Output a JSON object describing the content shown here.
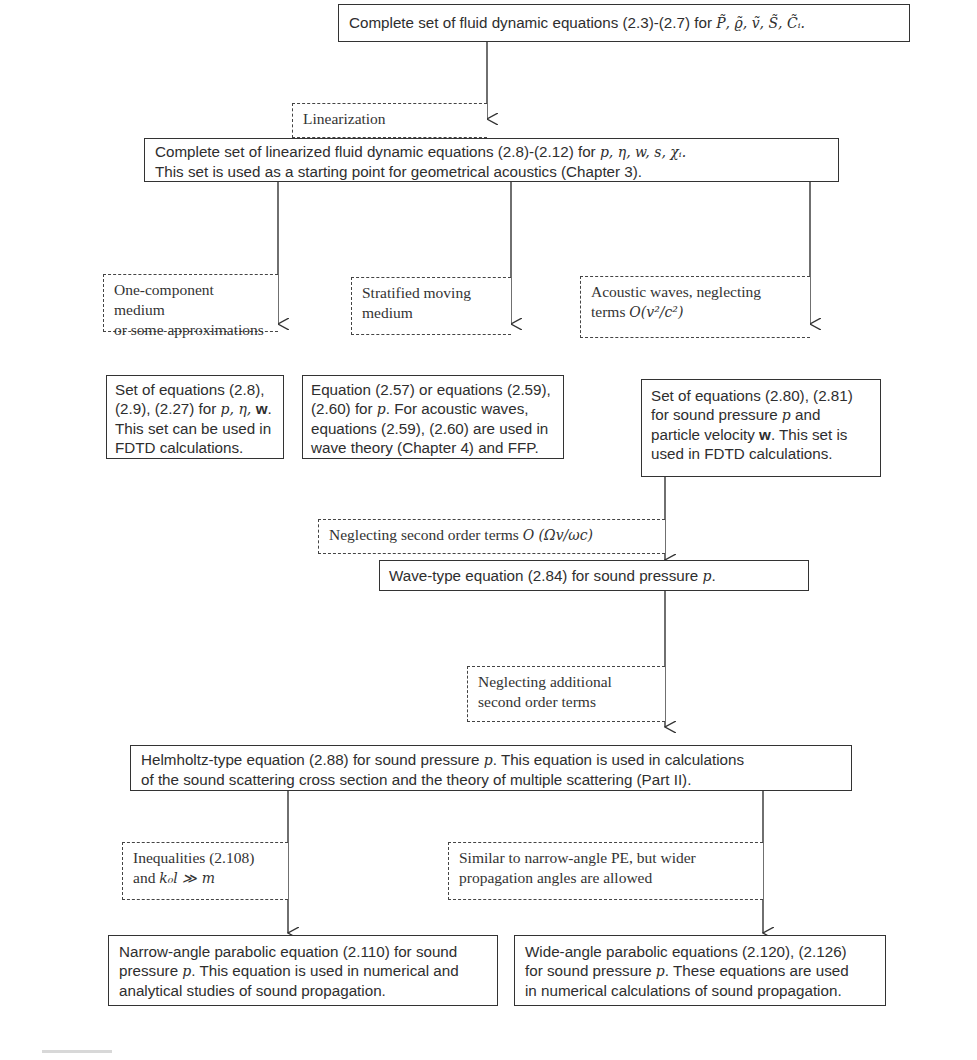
{
  "diagram": {
    "type": "flowchart",
    "nodes": {
      "n1": {
        "text": "Complete set of fluid dynamic equations (2.3)-(2.7) for ",
        "vars": "P̃, ϱ̃, ṽ, S̃, C̃ᵢ."
      },
      "c1": {
        "text": "Linearization"
      },
      "n2": {
        "line1": "Complete set of linearized fluid dynamic equations (2.8)-(2.12) for ",
        "line1_vars": "p, η, w, s, χᵢ.",
        "line2": "This set is used as a starting point for geometrical acoustics (Chapter 3)."
      },
      "c2a": {
        "line1": "One-component medium",
        "line2": "or some approximations"
      },
      "c2b": {
        "line1": "Stratified moving",
        "line2": "medium"
      },
      "c2c": {
        "line1": "Acoustic waves, neglecting",
        "line2_prefix": "terms ",
        "line2_math": "O(v²/c²)"
      },
      "n3a": {
        "line1": "Set of equations (2.8),",
        "line2_prefix": "(2.9), (2.27) for ",
        "line2_vars": "p, η, ",
        "line2_bold": "w",
        "line2_suffix": ".",
        "line3": "This set can be used in",
        "line4": "FDTD calculations."
      },
      "n3b": {
        "line1": "Equation (2.57) or equations (2.59),",
        "line2_prefix": "(2.60) for ",
        "line2_var": "p",
        "line2_suffix": ". For acoustic waves,",
        "line3": "equations (2.59), (2.60) are used in",
        "line4": "wave theory (Chapter 4) and FFP."
      },
      "n3c": {
        "line1": "Set of equations (2.80), (2.81)",
        "line2_prefix": "for sound pressure ",
        "line2_var": "p",
        "line2_suffix": " and",
        "line3_prefix": "particle velocity ",
        "line3_bold": "w",
        "line3_suffix": ". This set is",
        "line4": "used in FDTD calculations."
      },
      "c3": {
        "prefix": "Neglecting second order terms ",
        "math": "O (Ωv/ωc)"
      },
      "n4": {
        "prefix": "Wave-type equation (2.84) for sound pressure ",
        "var": "p",
        "suffix": "."
      },
      "c4": {
        "line1": "Neglecting additional",
        "line2": "second order terms"
      },
      "n5": {
        "line1_prefix": "Helmholtz-type equation (2.88) for sound pressure ",
        "line1_var": "p",
        "line1_suffix": ". This equation is used in calculations",
        "line2": "of the sound scattering cross section and the theory of multiple scattering (Part II)."
      },
      "c5a": {
        "line1": "Inequalities (2.108)",
        "line2_prefix": "and ",
        "line2_math": "k₀l ≫ m"
      },
      "c5b": {
        "line1": "Similar to narrow-angle PE, but wider",
        "line2": "propagation angles are allowed"
      },
      "n6a": {
        "line1": "Narrow-angle parabolic equation (2.110) for sound",
        "line2_prefix": "pressure ",
        "line2_var": "p",
        "line2_suffix": ". This equation is used in numerical and",
        "line3": "analytical studies of sound propagation."
      },
      "n6b": {
        "line1": "Wide-angle parabolic equations (2.120), (2.126)",
        "line2_prefix": "for sound pressure ",
        "line2_var": "p",
        "line2_suffix": ". These equations are used",
        "line3": "in numerical calculations of sound propagation."
      }
    },
    "edges": [
      {
        "from": "n1",
        "to": "n2",
        "label": "c1"
      },
      {
        "from": "n2",
        "to": "n3a",
        "label": "c2a"
      },
      {
        "from": "n2",
        "to": "n3b",
        "label": "c2b"
      },
      {
        "from": "n2",
        "to": "n3c",
        "label": "c2c"
      },
      {
        "from": "n3c",
        "to": "n4",
        "label": "c3"
      },
      {
        "from": "n4",
        "to": "n5",
        "label": "c4"
      },
      {
        "from": "n5",
        "to": "n6a",
        "label": "c5a"
      },
      {
        "from": "n5",
        "to": "n6b",
        "label": "c5b"
      }
    ],
    "colors": {
      "line": "#333333",
      "text": "#2e2e2e",
      "background": "#ffffff"
    }
  }
}
